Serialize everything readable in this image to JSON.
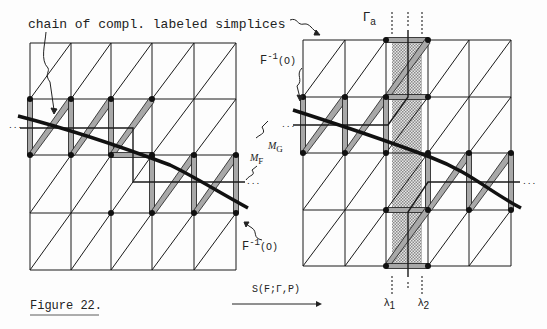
{
  "figure": {
    "caption": "Figure 22.",
    "left_annotation": "chain of compl. labeled simplices",
    "left_preimage_label": "F",
    "left_preimage_sup": "-1",
    "left_preimage_arg": "(O)",
    "right_preimage_label": "F",
    "right_preimage_sup": "-1",
    "right_preimage_arg": "(O)",
    "gamma_label": "Γ",
    "gamma_sub": "a",
    "manifold_F_label": "M",
    "manifold_F_sub": "F",
    "manifold_G_label": "M",
    "manifold_G_sub": "G",
    "arrow_label": "S(F;Γ,P)",
    "lambda1": "λ",
    "lambda1_sub": "1",
    "lambda2": "λ",
    "lambda2_sub": "2",
    "ellipsis": "..."
  },
  "colors": {
    "line": "#1a1a1a",
    "band_fill": "#a8a8a8",
    "stipple": "#b8b8b8",
    "background": "#fdfdfd"
  }
}
